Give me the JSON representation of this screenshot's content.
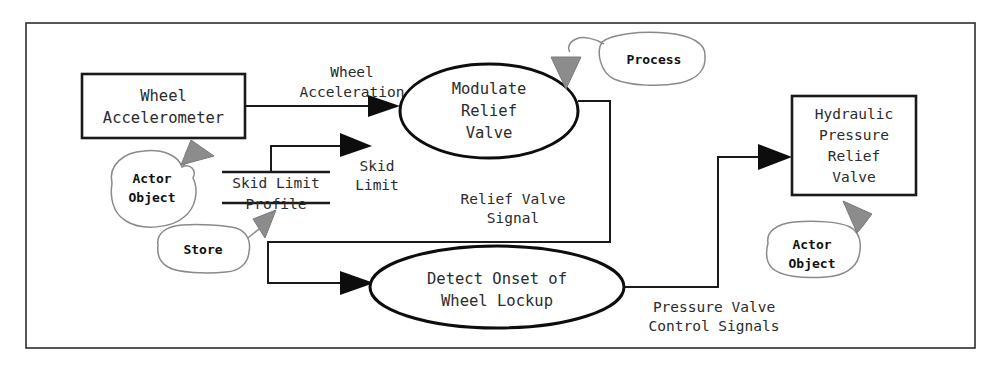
{
  "diagram": {
    "colors": {
      "stroke": "#1a1a1a",
      "text": "#2b2b2b",
      "annotation_stroke": "#8a8a8a",
      "annotation_arrow_fill": "#8c8c8c",
      "background": "#ffffff"
    },
    "frame": {
      "label": "diagram-frame"
    },
    "externals": [
      {
        "id": "wheel-accelerometer",
        "lines": [
          "Wheel",
          "Accelerometer"
        ]
      },
      {
        "id": "hydraulic-pressure-relief-valve",
        "lines": [
          "Hydraulic",
          "Pressure",
          "Relief",
          "Valve"
        ]
      }
    ],
    "processes": [
      {
        "id": "modulate-relief-valve",
        "lines": [
          "Modulate",
          "Relief",
          "Valve"
        ]
      },
      {
        "id": "detect-onset-of-wheel-lockup",
        "lines": [
          "Detect Onset of",
          "Wheel Lockup"
        ]
      }
    ],
    "stores": [
      {
        "id": "skid-limit-profile",
        "lines": [
          "Skid Limit",
          "Profile"
        ]
      }
    ],
    "flows": [
      {
        "id": "wheel-acceleration",
        "lines": [
          "Wheel",
          "Acceleration"
        ],
        "from": "wheel-accelerometer",
        "to": "modulate-relief-valve"
      },
      {
        "id": "skid-limit",
        "lines": [
          "Skid",
          "Limit"
        ],
        "from": "skid-limit-profile",
        "to": "modulate-relief-valve"
      },
      {
        "id": "relief-valve-signal",
        "lines": [
          "Relief Valve",
          "Signal"
        ],
        "from": "modulate-relief-valve",
        "to": "detect-onset-of-wheel-lockup"
      },
      {
        "id": "pressure-valve-control-signals",
        "lines": [
          "Pressure Valve",
          "Control Signals"
        ],
        "from": "detect-onset-of-wheel-lockup",
        "to": "hydraulic-pressure-relief-valve"
      }
    ],
    "annotations": [
      {
        "id": "annot-actor-object-left",
        "lines": [
          "Actor",
          "Object"
        ],
        "points_to": "wheel-accelerometer"
      },
      {
        "id": "annot-store",
        "lines": [
          "Store"
        ],
        "points_to": "skid-limit-profile"
      },
      {
        "id": "annot-process",
        "lines": [
          "Process"
        ],
        "points_to": "modulate-relief-valve"
      },
      {
        "id": "annot-actor-object-right",
        "lines": [
          "Actor",
          "Object"
        ],
        "points_to": "hydraulic-pressure-relief-valve"
      }
    ]
  }
}
